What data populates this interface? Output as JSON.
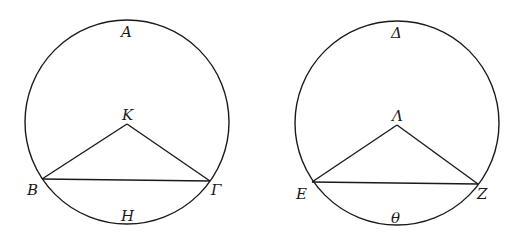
{
  "figures": [
    {
      "name": "left",
      "circle": {
        "cx": 127,
        "cy": 122,
        "r": 102
      },
      "center_point": {
        "label": "K",
        "x": 127,
        "y": 124
      },
      "chord_left": {
        "label": "B",
        "x": 42,
        "y": 179
      },
      "chord_right": {
        "label": "Γ",
        "x": 210,
        "y": 181
      },
      "arc_top_label": "A",
      "arc_bottom_label": "H"
    },
    {
      "name": "right",
      "circle": {
        "cx": 397,
        "cy": 123,
        "r": 102
      },
      "center_point": {
        "label": "Λ",
        "x": 397,
        "y": 125
      },
      "chord_left": {
        "label": "E",
        "x": 312,
        "y": 182
      },
      "chord_right": {
        "label": "Z",
        "x": 478,
        "y": 184
      },
      "arc_top_label": "Δ",
      "arc_bottom_label": "Θ"
    }
  ],
  "labels": {
    "left_top": "A",
    "left_center": "K",
    "left_B": "B",
    "left_G": "Γ",
    "left_bottom": "H",
    "right_top": "Δ",
    "right_center": "Λ",
    "right_E": "E",
    "right_Z": "Z",
    "right_bottom": "θ"
  },
  "colors": {
    "line": "#1a1a1a",
    "background": "#ffffff"
  }
}
